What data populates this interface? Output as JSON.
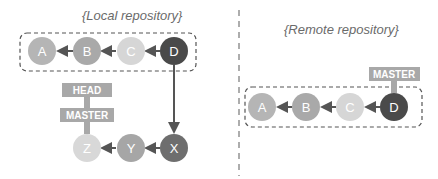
{
  "local": {
    "title": "{Local repository}",
    "commits": [
      {
        "id": "A",
        "color": "#b5b5b5"
      },
      {
        "id": "B",
        "color": "#a9a9a9"
      },
      {
        "id": "C",
        "color": "#d6d6d6"
      },
      {
        "id": "D",
        "color": "#4a4a4a"
      }
    ],
    "branch_commits": [
      {
        "id": "X",
        "color": "#6e6e6e"
      },
      {
        "id": "Y",
        "color": "#a6a6a6"
      },
      {
        "id": "Z",
        "color": "#d8d8d8"
      }
    ],
    "labels": {
      "head": "HEAD",
      "master": "MASTER"
    }
  },
  "remote": {
    "title": "{Remote repository}",
    "commits": [
      {
        "id": "A",
        "color": "#b5b5b5"
      },
      {
        "id": "B",
        "color": "#a9a9a9"
      },
      {
        "id": "C",
        "color": "#d6d6d6"
      },
      {
        "id": "D",
        "color": "#4a4a4a"
      }
    ],
    "labels": {
      "master": "MASTER"
    }
  },
  "colors": {
    "label_bg": "#a8a8a8",
    "arrow": "#555555",
    "dash": "#555555"
  }
}
